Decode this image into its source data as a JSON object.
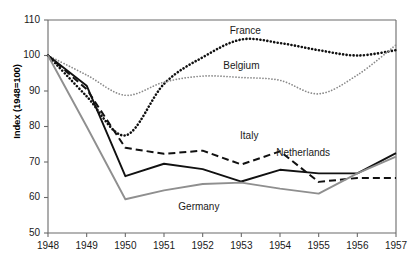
{
  "chart_data": {
    "type": "line",
    "title": "",
    "xlabel": "",
    "ylabel": "Index  (1948=100)",
    "x": [
      1948,
      1949,
      1950,
      1951,
      1952,
      1953,
      1954,
      1955,
      1956,
      1957
    ],
    "xtick_labels": [
      "1948",
      "1949",
      "1950",
      "1951",
      "1952",
      "1953",
      "1954",
      "1955",
      "1956",
      "1957"
    ],
    "ytick_labels": [
      "50",
      "60",
      "70",
      "80",
      "90",
      "100",
      "110"
    ],
    "yticks": [
      50,
      60,
      70,
      80,
      90,
      100,
      110
    ],
    "ylim": [
      50,
      110
    ],
    "xlim": [
      1948,
      1957
    ],
    "grid": false,
    "legend_position": "inline-labels",
    "series": [
      {
        "name": "France",
        "style": "dotted-bold",
        "color": "#111111",
        "values": [
          100,
          88.5,
          77.5,
          92.0,
          99.5,
          104.5,
          103.5,
          101.5,
          100.0,
          101.5
        ],
        "label_x": 1953.1,
        "label_y": 106.5
      },
      {
        "name": "Belgium",
        "style": "dotted-fine",
        "color": "#8a8a8a",
        "values": [
          100,
          94.5,
          88.8,
          92.5,
          94.2,
          93.8,
          93.0,
          89.2,
          94.5,
          103.0
        ],
        "label_x": 1953.0,
        "label_y": 96.8
      },
      {
        "name": "Italy",
        "style": "dashed",
        "color": "#111111",
        "values": [
          100,
          90.5,
          74.0,
          72.3,
          73.2,
          69.3,
          73.0,
          64.4,
          65.5,
          65.5
        ],
        "label_x": 1953.2,
        "label_y": 77.0
      },
      {
        "name": "Netherlands",
        "style": "solid",
        "color": "#111111",
        "values": [
          100,
          91.5,
          66.0,
          69.5,
          68.0,
          64.5,
          67.8,
          66.8,
          66.8,
          72.5
        ],
        "label_x": 1954.6,
        "label_y": 72.2
      },
      {
        "name": "Germany",
        "style": "solid",
        "color": "#8f8f8f",
        "values": [
          100,
          80.0,
          59.5,
          62.0,
          63.8,
          64.2,
          62.5,
          61.1,
          66.8,
          71.5
        ],
        "label_x": 1951.9,
        "label_y": 57.0
      }
    ]
  },
  "colors": {
    "axis": "#6b6b6b",
    "text": "#1a1a1a",
    "background": "#ffffff",
    "france": "#111111",
    "belgium": "#8a8a8a",
    "italy": "#111111",
    "netherlands": "#111111",
    "germany": "#8f8f8f"
  }
}
